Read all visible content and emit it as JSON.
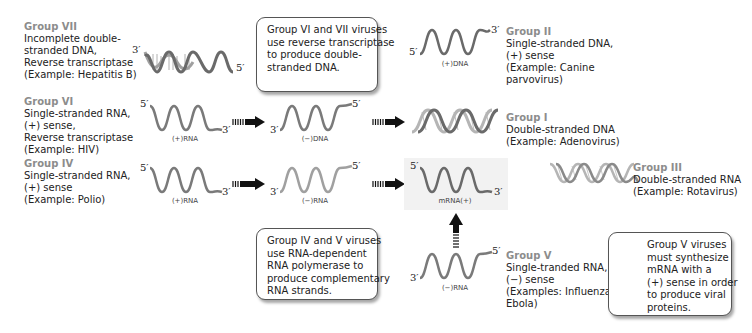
{
  "groups": {
    "g7": {
      "title": "Group VII",
      "lines": [
        "Incomplete double-",
        "stranded DNA,",
        "Reverse transcriptase",
        "(Example: Hepatitis B)"
      ]
    },
    "g6": {
      "title": "Group VI",
      "lines": [
        "Single-stranded RNA,",
        "(+) sense,",
        "Reverse transcriptase",
        "(Example: HIV)"
      ]
    },
    "g4": {
      "title": "Group IV",
      "lines": [
        "Single-stranded RNA,",
        "(+) sense",
        "(Example: Polio)"
      ]
    },
    "g2": {
      "title": "Group II",
      "lines": [
        "Single-stranded DNA,",
        "(+) sense",
        "(Example:  Canine",
        "parvovirus)"
      ]
    },
    "g1": {
      "title": "Group I",
      "lines": [
        "Double-stranded DNA",
        "(Example: Adenovirus)"
      ]
    },
    "g3": {
      "title": "Group III",
      "lines": [
        "Double-stranded RNA",
        "(Example: Rotavirus)"
      ]
    },
    "g5": {
      "title": "Group V",
      "lines": [
        "Single-tranded RNA,",
        "(−) sense",
        "(Examples: Influenza,",
        "Ebola)"
      ]
    }
  },
  "notes": {
    "rt": [
      "Group VI and VII viruses",
      "use reverse transcriptase",
      "to produce double-",
      "stranded DNA."
    ],
    "rdrp": [
      "Group IV and V viruses",
      "use RNA-dependent",
      "RNA polymerase to",
      "produce complementary",
      "RNA strands."
    ],
    "g5": [
      "Group V viruses",
      "must synthesize",
      "mRNA with a",
      "(+) sense in order",
      "to produce viral",
      "proteins."
    ]
  },
  "strand_labels": {
    "plus_dna": "(+)DNA",
    "g6_plus_rna": "(+)RNA",
    "minus_dna": "(−)DNA",
    "g4_plus_rna": "(+)RNA",
    "g4_minus_rna": "(−)RNA",
    "mrna": "mRNA(+)",
    "g5_minus_rna": "(−)RNA"
  },
  "ends": {
    "three": "3′",
    "five": "5′"
  },
  "colors": {
    "group_title": "#8c8c8c",
    "strand": "#7a7a7a",
    "strand_light": "#b5b5b5",
    "arrow": "#111111"
  }
}
